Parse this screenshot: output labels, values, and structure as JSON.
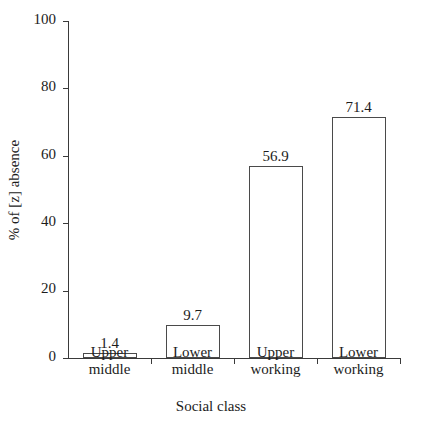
{
  "chart_data": {
    "type": "bar",
    "title": "",
    "subtitle": "",
    "xlabel": "Social class",
    "ylabel": "% of [z] absence",
    "categories": [
      "Upper\nmiddle",
      "Lower\nmiddle",
      "Upper\nworking",
      "Lower\nworking"
    ],
    "values": [
      1.4,
      9.7,
      56.9,
      71.4
    ],
    "value_labels": [
      "1.4",
      "9.7",
      "56.9",
      "71.4"
    ],
    "ylim": [
      0,
      100
    ],
    "yticks": [
      0,
      20,
      40,
      60,
      80,
      100
    ],
    "ytick_labels": [
      "0",
      "20",
      "40",
      "60",
      "80",
      "100"
    ],
    "grid": false,
    "legend": false,
    "legend_position": "none",
    "bar_facecolor": "#ffffff",
    "bar_edgecolor": "#4a4a4a",
    "axis_color": "#3a3a3a",
    "text_color": "#1c1c1c",
    "background": "#ffffff"
  }
}
